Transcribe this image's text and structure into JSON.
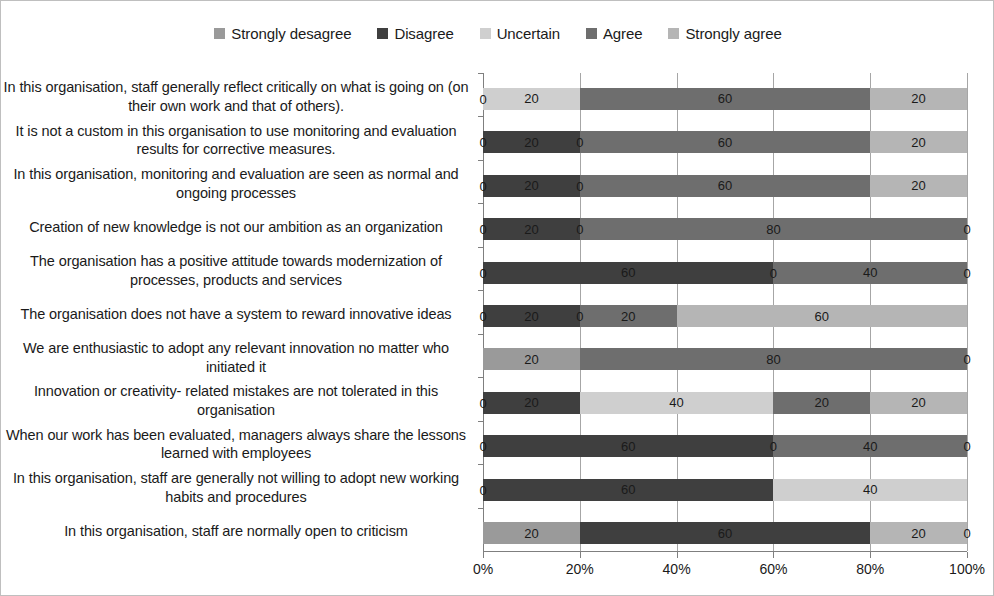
{
  "chart_data": {
    "type": "bar",
    "subtype": "stacked-bar-100-horizontal",
    "title": "",
    "xlabel": "",
    "ylabel": "",
    "xlim": [
      0,
      100
    ],
    "xticks": [
      "0%",
      "20%",
      "40%",
      "60%",
      "80%",
      "100%"
    ],
    "xtick_values": [
      0,
      20,
      40,
      60,
      80,
      100
    ],
    "grid": true,
    "legend_position": "top-center",
    "orientation": "horizontal",
    "legend": [
      {
        "label": "Strongly desagree",
        "color": "#9a9a9a"
      },
      {
        "label": "Disagree",
        "color": "#3f3f3f"
      },
      {
        "label": "Uncertain",
        "color": "#cfcfcf"
      },
      {
        "label": "Agree",
        "color": "#6e6e6e"
      },
      {
        "label": "Strongly agree",
        "color": "#b5b5b5"
      }
    ],
    "series": [
      {
        "name": "Strongly desagree",
        "color": "#9a9a9a",
        "values": [
          0,
          0,
          0,
          0,
          0,
          0,
          20,
          0,
          0,
          0,
          20
        ]
      },
      {
        "name": "Disagree",
        "color": "#3f3f3f",
        "values": [
          0,
          20,
          20,
          20,
          60,
          20,
          0,
          20,
          60,
          60,
          60
        ]
      },
      {
        "name": "Uncertain",
        "color": "#cfcfcf",
        "values": [
          20,
          0,
          0,
          0,
          0,
          0,
          0,
          40,
          0,
          40,
          0
        ]
      },
      {
        "name": "Agree",
        "color": "#6e6e6e",
        "values": [
          60,
          60,
          60,
          80,
          40,
          20,
          80,
          20,
          40,
          0,
          0
        ]
      },
      {
        "name": "Strongly agree",
        "color": "#b5b5b5",
        "values": [
          20,
          20,
          20,
          0,
          0,
          60,
          0,
          20,
          0,
          0,
          20
        ]
      }
    ],
    "categories": [
      "In this organisation, staff generally reflect critically on what is going on (on their own work and that of others).",
      "It is not a custom in this organisation to use monitoring and evaluation results for corrective measures.",
      "In this organisation, monitoring and evaluation are seen as normal and ongoing processes",
      "Creation of new knowledge is not our ambition as an organization",
      "The organisation has a positive attitude towards modernization of processes, products and services",
      "The organisation does not have a system to reward innovative ideas",
      "We are enthusiastic to adopt any relevant innovation no matter who initiated it",
      "Innovation or creativity- related mistakes are not tolerated in this organisation",
      "When our work has been evaluated, managers always share the lessons learned with employees",
      "In this organisation, staff are generally not willing to adopt new working habits and procedures",
      "In this organisation, staff are normally open to criticism"
    ],
    "rows": [
      {
        "category_index": 0,
        "segments": [
          {
            "series": "Strongly desagree",
            "value": 0,
            "label": "0"
          },
          {
            "series": "Disagree",
            "value": 0,
            "label": ""
          },
          {
            "series": "Uncertain",
            "value": 20,
            "label": "20"
          },
          {
            "series": "Agree",
            "value": 60,
            "label": "60"
          },
          {
            "series": "Strongly agree",
            "value": 20,
            "label": "20"
          }
        ]
      },
      {
        "category_index": 1,
        "segments": [
          {
            "series": "Strongly desagree",
            "value": 0,
            "label": "0"
          },
          {
            "series": "Disagree",
            "value": 20,
            "label": "20"
          },
          {
            "series": "Uncertain",
            "value": 0,
            "label": "0"
          },
          {
            "series": "Agree",
            "value": 60,
            "label": "60"
          },
          {
            "series": "Strongly agree",
            "value": 20,
            "label": "20"
          }
        ]
      },
      {
        "category_index": 2,
        "segments": [
          {
            "series": "Strongly desagree",
            "value": 0,
            "label": "0"
          },
          {
            "series": "Disagree",
            "value": 20,
            "label": "20"
          },
          {
            "series": "Uncertain",
            "value": 0,
            "label": "0"
          },
          {
            "series": "Agree",
            "value": 60,
            "label": "60"
          },
          {
            "series": "Strongly agree",
            "value": 20,
            "label": "20"
          }
        ]
      },
      {
        "category_index": 3,
        "segments": [
          {
            "series": "Strongly desagree",
            "value": 0,
            "label": "0"
          },
          {
            "series": "Disagree",
            "value": 20,
            "label": "20"
          },
          {
            "series": "Uncertain",
            "value": 0,
            "label": "0"
          },
          {
            "series": "Agree",
            "value": 80,
            "label": "80"
          },
          {
            "series": "Strongly agree",
            "value": 0,
            "label": "0"
          }
        ]
      },
      {
        "category_index": 4,
        "segments": [
          {
            "series": "Strongly desagree",
            "value": 0,
            "label": "0"
          },
          {
            "series": "Disagree",
            "value": 60,
            "label": "60"
          },
          {
            "series": "Uncertain",
            "value": 0,
            "label": "0"
          },
          {
            "series": "Agree",
            "value": 40,
            "label": "40"
          },
          {
            "series": "Strongly agree",
            "value": 0,
            "label": "0"
          }
        ]
      },
      {
        "category_index": 5,
        "segments": [
          {
            "series": "Strongly desagree",
            "value": 0,
            "label": "0"
          },
          {
            "series": "Disagree",
            "value": 20,
            "label": "20"
          },
          {
            "series": "Uncertain",
            "value": 0,
            "label": "0"
          },
          {
            "series": "Agree",
            "value": 20,
            "label": "20"
          },
          {
            "series": "Strongly agree",
            "value": 60,
            "label": "60"
          }
        ]
      },
      {
        "category_index": 6,
        "segments": [
          {
            "series": "Strongly desagree",
            "value": 20,
            "label": "20"
          },
          {
            "series": "Disagree",
            "value": 0,
            "label": ""
          },
          {
            "series": "Uncertain",
            "value": 0,
            "label": ""
          },
          {
            "series": "Agree",
            "value": 80,
            "label": "80"
          },
          {
            "series": "Strongly agree",
            "value": 0,
            "label": "0"
          }
        ]
      },
      {
        "category_index": 7,
        "segments": [
          {
            "series": "Strongly desagree",
            "value": 0,
            "label": "0"
          },
          {
            "series": "Disagree",
            "value": 20,
            "label": "20"
          },
          {
            "series": "Uncertain",
            "value": 40,
            "label": "40"
          },
          {
            "series": "Agree",
            "value": 20,
            "label": "20"
          },
          {
            "series": "Strongly agree",
            "value": 20,
            "label": "20"
          }
        ]
      },
      {
        "category_index": 8,
        "segments": [
          {
            "series": "Strongly desagree",
            "value": 0,
            "label": "0"
          },
          {
            "series": "Disagree",
            "value": 60,
            "label": "60"
          },
          {
            "series": "Uncertain",
            "value": 0,
            "label": "0"
          },
          {
            "series": "Agree",
            "value": 40,
            "label": "40"
          },
          {
            "series": "Strongly agree",
            "value": 0,
            "label": "0"
          }
        ]
      },
      {
        "category_index": 9,
        "segments": [
          {
            "series": "Strongly desagree",
            "value": 0,
            "label": "0"
          },
          {
            "series": "Disagree",
            "value": 60,
            "label": "60"
          },
          {
            "series": "Uncertain",
            "value": 40,
            "label": "40"
          },
          {
            "series": "Agree",
            "value": 0,
            "label": ""
          },
          {
            "series": "Strongly agree",
            "value": 0,
            "label": ""
          }
        ]
      },
      {
        "category_index": 10,
        "segments": [
          {
            "series": "Strongly desagree",
            "value": 20,
            "label": "20"
          },
          {
            "series": "Disagree",
            "value": 60,
            "label": "60"
          },
          {
            "series": "Uncertain",
            "value": 0,
            "label": ""
          },
          {
            "series": "Agree",
            "value": 0,
            "label": ""
          },
          {
            "series": "Strongly agree",
            "value": 20,
            "label": "20"
          },
          {
            "series": "__end__",
            "value": 0,
            "label": "0"
          }
        ]
      }
    ]
  },
  "colors": {
    "frame_border": "#bfbfbf",
    "gridline": "#a6a6a6",
    "axis": "#7f7f7f",
    "text": "#1a1a1a",
    "background": "#ffffff"
  }
}
